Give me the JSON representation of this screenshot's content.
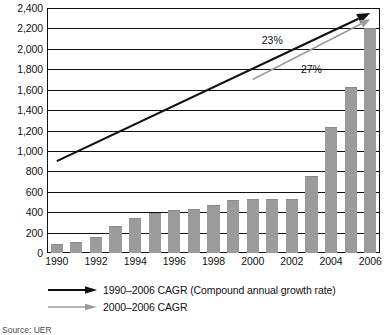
{
  "chart_data": {
    "type": "bar",
    "title": "",
    "subtitle": "",
    "xlabel": "",
    "ylabel": "",
    "ylim": [
      0,
      2400
    ],
    "ytick_step": 200,
    "grid": true,
    "legend_position": "below",
    "categories": [
      "1990",
      "1991",
      "1992",
      "1993",
      "1994",
      "1995",
      "1996",
      "1997",
      "1998",
      "1999",
      "2000",
      "2001",
      "2002",
      "2003",
      "2004",
      "2005",
      "2006"
    ],
    "x_tick_labels": [
      "1990",
      "1992",
      "1994",
      "1996",
      "1998",
      "2000",
      "2002",
      "2004",
      "2006"
    ],
    "y_tick_labels": [
      "0",
      "200",
      "400",
      "600",
      "800",
      "1,000",
      "1,200",
      "1,400",
      "1,600",
      "1,800",
      "2,000",
      "2,200",
      "2,400"
    ],
    "values": [
      90,
      110,
      160,
      260,
      340,
      390,
      420,
      430,
      470,
      520,
      530,
      530,
      530,
      750,
      1230,
      1630,
      2200
    ],
    "series": [
      {
        "name": "bars",
        "values": [
          90,
          110,
          160,
          260,
          340,
          390,
          420,
          430,
          470,
          520,
          530,
          530,
          530,
          750,
          1230,
          1630,
          2200
        ]
      }
    ],
    "annotations": [
      {
        "text": "23%",
        "x_category": "2001",
        "y_value": 2090
      },
      {
        "text": "27%",
        "x_category": "2003",
        "y_value": 1800
      }
    ],
    "trendlines": [
      {
        "name": "1990-2006 CAGR",
        "color": "#111111",
        "start": {
          "x_category": "1990",
          "y_value": 900
        },
        "end": {
          "x_category": "2006",
          "y_value": 2350
        }
      },
      {
        "name": "2000-2006 CAGR",
        "color": "#9b9b9b",
        "start": {
          "x_category": "2000",
          "y_value": 1700
        },
        "end": {
          "x_category": "2006",
          "y_value": 2290
        }
      }
    ]
  },
  "legend": {
    "items": [
      {
        "label": "1990–2006 CAGR (Compound annual growth rate)",
        "color": "#111111",
        "icon": "arrow-right-icon"
      },
      {
        "label": "2000–2006 CAGR",
        "color": "#9b9b9b",
        "icon": "arrow-right-icon"
      }
    ]
  },
  "source": {
    "text": "Source: UER"
  }
}
